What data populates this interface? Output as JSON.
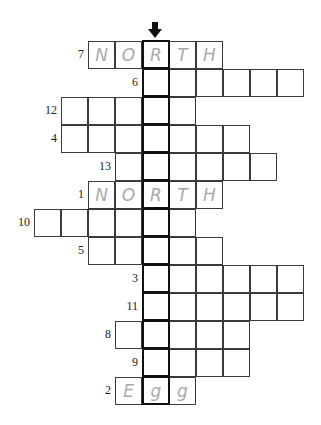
{
  "puzzle": {
    "highlight_column": 4,
    "arrow_icon": "down-arrow",
    "cell_origin_x": 34,
    "cell_origin_y": 41,
    "rows": [
      {
        "number": "7",
        "start_col": 2,
        "length": 5,
        "letters": [
          "N",
          "O",
          "R",
          "T",
          "H"
        ]
      },
      {
        "number": "6",
        "start_col": 4,
        "length": 6,
        "letters": [
          "",
          "",
          "",
          "",
          "",
          ""
        ]
      },
      {
        "number": "12",
        "start_col": 1,
        "length": 5,
        "letters": [
          "",
          "",
          "",
          "",
          ""
        ]
      },
      {
        "number": "4",
        "start_col": 1,
        "length": 7,
        "letters": [
          "",
          "",
          "",
          "",
          "",
          "",
          ""
        ]
      },
      {
        "number": "13",
        "start_col": 3,
        "length": 6,
        "letters": [
          "",
          "",
          "",
          "",
          "",
          ""
        ]
      },
      {
        "number": "1",
        "start_col": 2,
        "length": 5,
        "letters": [
          "N",
          "O",
          "R",
          "T",
          "H"
        ]
      },
      {
        "number": "10",
        "start_col": 0,
        "length": 6,
        "letters": [
          "",
          "",
          "",
          "",
          "",
          ""
        ]
      },
      {
        "number": "5",
        "start_col": 2,
        "length": 5,
        "letters": [
          "",
          "",
          "",
          "",
          ""
        ]
      },
      {
        "number": "3",
        "start_col": 4,
        "length": 6,
        "letters": [
          "",
          "",
          "",
          "",
          "",
          ""
        ]
      },
      {
        "number": "11",
        "start_col": 4,
        "length": 6,
        "letters": [
          "",
          "",
          "",
          "",
          "",
          ""
        ]
      },
      {
        "number": "8",
        "start_col": 3,
        "length": 5,
        "letters": [
          "",
          "",
          "",
          "",
          ""
        ]
      },
      {
        "number": "9",
        "start_col": 4,
        "length": 4,
        "letters": [
          "",
          "",
          "",
          ""
        ]
      },
      {
        "number": "2",
        "start_col": 3,
        "length": 3,
        "letters": [
          "E",
          "g",
          "g"
        ]
      }
    ]
  }
}
